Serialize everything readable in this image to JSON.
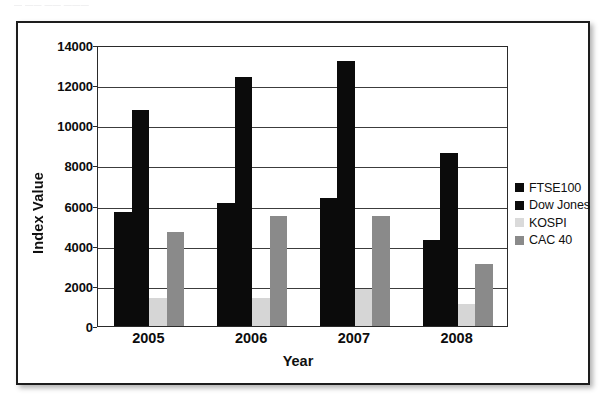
{
  "scan": {
    "top_caption_fragment": "— —— —— ———"
  },
  "chart_data": {
    "type": "bar",
    "title": "",
    "xlabel": "Year",
    "ylabel": "Index Value",
    "categories": [
      "2005",
      "2006",
      "2007",
      "2008"
    ],
    "series": [
      {
        "name": "FTSE100",
        "color": "#0b0b0b",
        "values": [
          5700,
          6150,
          6400,
          4300
        ]
      },
      {
        "name": "Dow Jones",
        "color": "#0b0b0b",
        "values": [
          10750,
          12400,
          13200,
          8600
        ]
      },
      {
        "name": "KOSPI",
        "color": "#d6d6d6",
        "values": [
          1400,
          1400,
          1850,
          1100
        ]
      },
      {
        "name": "CAC 40",
        "color": "#8a8a8a",
        "values": [
          4700,
          5500,
          5500,
          3100
        ]
      }
    ],
    "ylim": [
      0,
      14000
    ],
    "ytick_step": 2000,
    "yticks": [
      0,
      2000,
      4000,
      6000,
      8000,
      10000,
      12000,
      14000
    ],
    "ytick_labels": [
      "0",
      "2000",
      "4000",
      "6000",
      "8000",
      "10000",
      "12000",
      "14000"
    ],
    "grid": true,
    "grid_axis": "y",
    "legend_position": "right",
    "legend_entries": [
      "FTSE100",
      "Dow Jones",
      "KOSPI",
      "CAC 40"
    ]
  }
}
